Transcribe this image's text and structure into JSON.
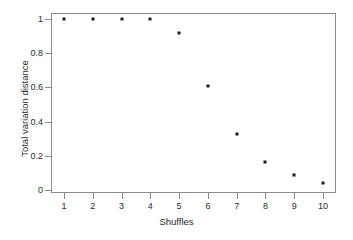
{
  "chart_data": {
    "type": "scatter",
    "title": "",
    "xlabel": "Shuffles",
    "ylabel": "Total variation distance",
    "x": [
      1,
      2,
      3,
      4,
      5,
      6,
      7,
      8,
      9,
      10
    ],
    "values": [
      1,
      1,
      1,
      1,
      0.92,
      0.61,
      0.33,
      0.165,
      0.085,
      0.04
    ],
    "xticks": [
      "1",
      "2",
      "3",
      "4",
      "5",
      "6",
      "7",
      "8",
      "9",
      "10"
    ],
    "xtick_values": [
      1,
      2,
      3,
      4,
      5,
      6,
      7,
      8,
      9,
      10
    ],
    "yticks": [
      "0",
      "0.2",
      "0.4",
      "0.6",
      "0.8",
      "1"
    ],
    "ytick_values": [
      0,
      0.2,
      0.4,
      0.6,
      0.8,
      1
    ],
    "xlim": [
      0.55,
      10.45
    ],
    "ylim": [
      -0.018,
      1.035
    ],
    "grid": false,
    "legend": null,
    "marker": "square-dot",
    "marker_color": "#1a1a1a",
    "frame_color": "#8b8b8b",
    "background": "#ffffff"
  }
}
